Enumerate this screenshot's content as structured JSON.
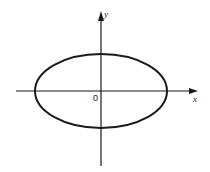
{
  "diagram": {
    "title": "",
    "type": "ellipse on coordinate axes",
    "axes": {
      "x_label": "x",
      "y_label": "y",
      "origin_label": "0"
    },
    "ellipse": {
      "center": [
        0,
        0
      ],
      "semi_major_axis": "horizontal",
      "rx_px": 66,
      "ry_px": 39
    },
    "colors": {
      "stroke": "#1a1a1a",
      "background": "#ffffff"
    }
  }
}
